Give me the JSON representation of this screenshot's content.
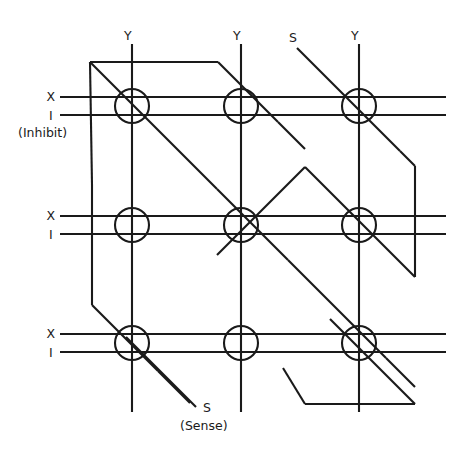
{
  "diagram": {
    "type": "schematic",
    "canvas": {
      "width": 458,
      "height": 460,
      "background": "#ffffff"
    },
    "stroke_color": "#1a1a1a",
    "grid": {
      "rows": 3,
      "columns": 3,
      "core_count": 9,
      "core_radius": 17
    },
    "labels": {
      "y_top_1": "Y",
      "y_top_2": "Y",
      "y_top_3": "Y",
      "s_top": "S",
      "s_bottom": "S",
      "sense_caption": "(Sense)",
      "inhibit_caption": "(Inhibit)",
      "row1_x": "X",
      "row1_i": "I",
      "row2_x": "X",
      "row2_i": "I",
      "row3_x": "X",
      "row3_i": "I"
    },
    "wires": [
      {
        "name": "X drive line",
        "symbol": "X",
        "orientation": "horizontal",
        "count": 3
      },
      {
        "name": "Inhibit line",
        "symbol": "I",
        "orientation": "horizontal",
        "count": 3
      },
      {
        "name": "Y drive line",
        "symbol": "Y",
        "orientation": "vertical",
        "count": 3
      },
      {
        "name": "Sense line",
        "symbol": "S",
        "orientation": "diagonal-serpentine",
        "count": 1
      }
    ],
    "geometry": {
      "column_x": [
        132,
        241,
        359
      ],
      "row_x_line_y": [
        97,
        216,
        334
      ],
      "row_i_line_y": [
        115,
        234,
        352
      ],
      "core_centers_y": [
        106,
        225,
        343
      ],
      "horizontal_line_start_x": 60,
      "horizontal_line_end_x": 446,
      "vertical_line_start_y": 44,
      "vertical_line_end_y": 412
    }
  }
}
